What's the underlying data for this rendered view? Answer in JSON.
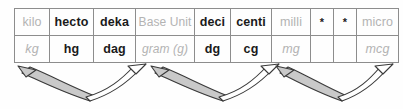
{
  "table": {
    "columns": [
      {
        "prefix": "kilo",
        "symbol": "kg",
        "prefix_muted": true,
        "symbol_muted": true,
        "width_class": "c0"
      },
      {
        "prefix": "hecto",
        "symbol": "hg",
        "prefix_muted": false,
        "symbol_muted": false,
        "width_class": "c1"
      },
      {
        "prefix": "deka",
        "symbol": "dag",
        "prefix_muted": false,
        "symbol_muted": false,
        "width_class": "c2"
      },
      {
        "prefix": "Base Unit",
        "symbol": "gram (g)",
        "prefix_muted": true,
        "symbol_muted": true,
        "width_class": "c3"
      },
      {
        "prefix": "deci",
        "symbol": "dg",
        "prefix_muted": false,
        "symbol_muted": false,
        "width_class": "c4"
      },
      {
        "prefix": "centi",
        "symbol": "cg",
        "prefix_muted": false,
        "symbol_muted": false,
        "width_class": "c5"
      },
      {
        "prefix": "milli",
        "symbol": "mg",
        "prefix_muted": true,
        "symbol_muted": true,
        "width_class": "c6"
      },
      {
        "prefix": "*",
        "symbol": "",
        "prefix_muted": false,
        "symbol_muted": false,
        "width_class": "c7"
      },
      {
        "prefix": "*",
        "symbol": "",
        "prefix_muted": false,
        "symbol_muted": false,
        "width_class": "c8"
      },
      {
        "prefix": "micro",
        "symbol": "mcg",
        "prefix_muted": true,
        "symbol_muted": true,
        "width_class": "c9"
      }
    ],
    "rows": {
      "prefix_row": [
        "kilo",
        "hecto",
        "deka",
        "Base Unit",
        "deci",
        "centi",
        "milli",
        "*",
        "*",
        "micro"
      ],
      "symbol_row": [
        "kg",
        "hg",
        "dag",
        "gram (g)",
        "dg",
        "cg",
        "mg",
        "",
        "",
        "mcg"
      ]
    }
  },
  "arrows": {
    "groups": [
      {
        "name": "arrow-group-1",
        "filled_arrow": {
          "direction": "left-up",
          "fill": "#c9c9c9"
        },
        "open_arrow": {
          "direction": "right-up",
          "fill": "#ffffff"
        }
      },
      {
        "name": "arrow-group-2",
        "filled_arrow": {
          "direction": "left-up",
          "fill": "#c9c9c9"
        },
        "open_arrow": {
          "direction": "right-up",
          "fill": "#ffffff"
        }
      },
      {
        "name": "arrow-group-3",
        "filled_arrow": {
          "direction": "left-up",
          "fill": "#c9c9c9"
        },
        "open_arrow": {
          "direction": "right-up",
          "fill": "#ffffff"
        }
      }
    ]
  },
  "colors": {
    "border": "#8d8d8d",
    "text": "#1a1a1a",
    "muted_text": "#b3b3b3",
    "arrow_fill": "#c9c9c9",
    "arrow_stroke": "#3a3a3a",
    "background": "#fefefe"
  }
}
